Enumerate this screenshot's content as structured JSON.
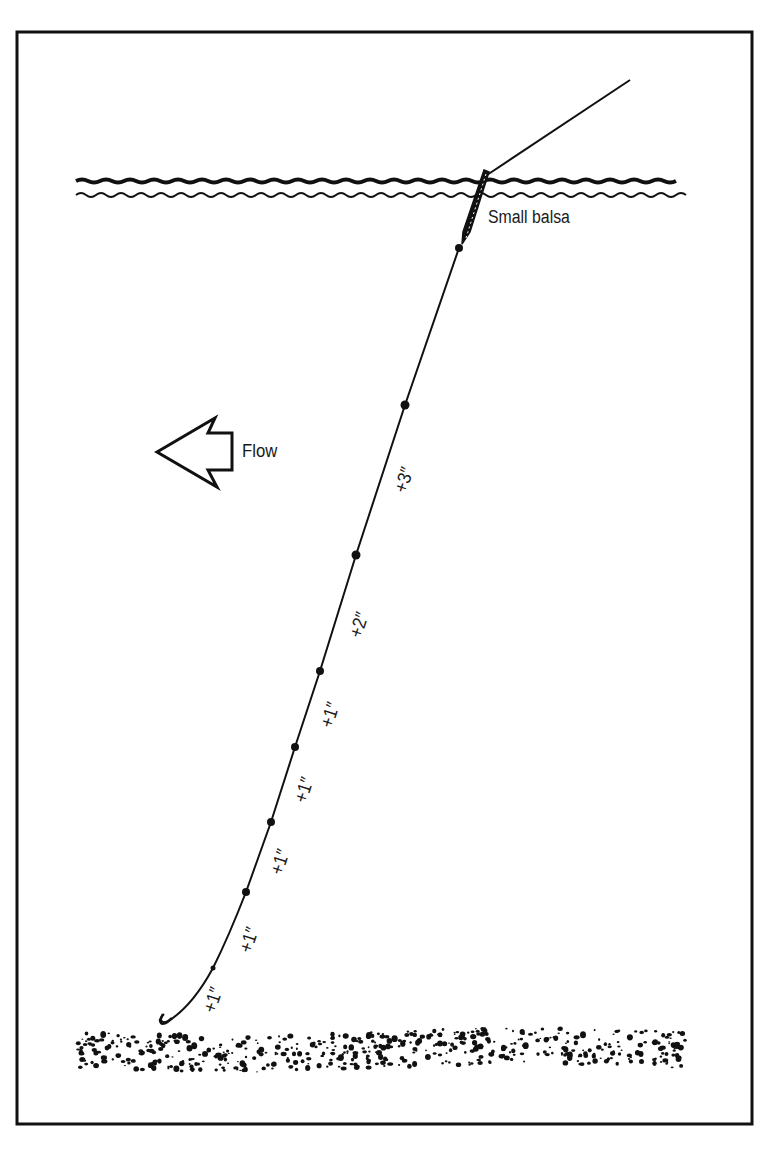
{
  "diagram": {
    "labels": {
      "float": "Small balsa",
      "flow": "Flow"
    },
    "shot_spacings": [
      {
        "label": "+3″",
        "x": 404,
        "y": 480
      },
      {
        "label": "+2″",
        "x": 359,
        "y": 625
      },
      {
        "label": "+1″",
        "x": 330,
        "y": 715
      },
      {
        "label": "+1″",
        "x": 304,
        "y": 790
      },
      {
        "label": "+1″",
        "x": 280,
        "y": 862
      },
      {
        "label": "+1″",
        "x": 249,
        "y": 940
      },
      {
        "label": "+1″",
        "x": 213,
        "y": 1000
      }
    ],
    "colors": {
      "ink": "#111111",
      "paper": "#ffffff"
    }
  }
}
